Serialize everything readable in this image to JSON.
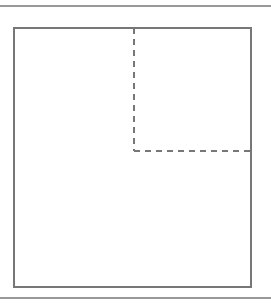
{
  "diagram": {
    "width": 271,
    "height": 304,
    "background": "#ffffff",
    "rule_color": "#999999",
    "line_color": "#777777",
    "top_rule": {
      "x1": 0,
      "y1": 6,
      "x2": 271,
      "y2": 6
    },
    "bottom_rule": {
      "x1": 0,
      "y1": 298,
      "x2": 271,
      "y2": 298
    },
    "outer_rect": {
      "x": 14,
      "y": 28,
      "width": 237,
      "height": 259
    },
    "dashed_vertical": {
      "x1": 134,
      "y1": 28,
      "x2": 134,
      "y2": 151
    },
    "dashed_horizontal": {
      "x1": 134,
      "y1": 151,
      "x2": 251,
      "y2": 151
    },
    "dash_pattern": "6,5"
  }
}
